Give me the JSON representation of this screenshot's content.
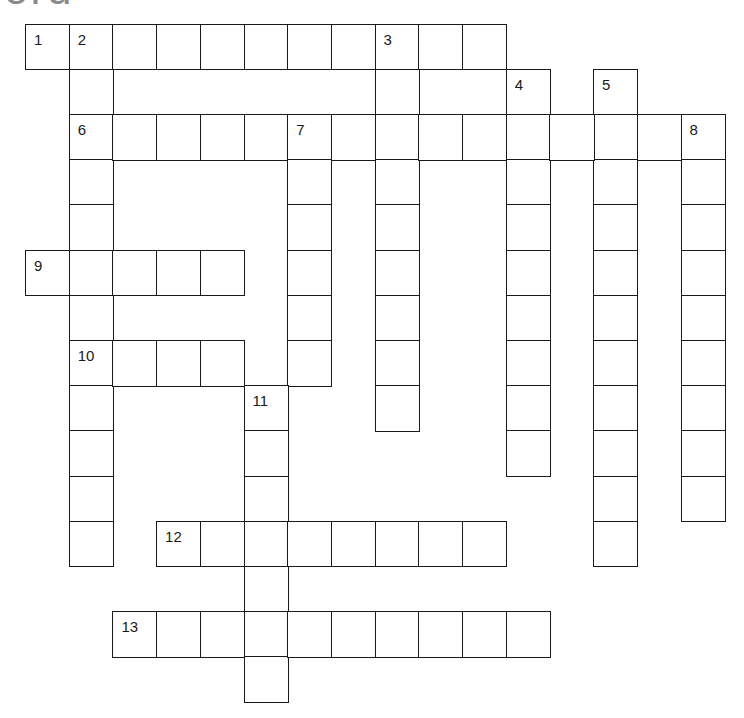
{
  "page": {
    "title_fragment": "ord"
  },
  "grid": {
    "origin_x": 25,
    "origin_y": 23.5,
    "cell_w": 43.7,
    "cell_h": 45.2,
    "border_color": "#1a1a1a",
    "cell_fill": "#ffffff"
  },
  "entries": [
    {
      "number": "1",
      "direction": "across",
      "row": 0,
      "col": 0,
      "length": 11
    },
    {
      "number": "2",
      "direction": "down",
      "row": 0,
      "col": 1,
      "length": 12
    },
    {
      "number": "3",
      "direction": "down",
      "row": 0,
      "col": 8,
      "length": 9
    },
    {
      "number": "4",
      "direction": "down",
      "row": 1,
      "col": 11,
      "length": 9
    },
    {
      "number": "5",
      "direction": "down",
      "row": 1,
      "col": 13,
      "length": 11
    },
    {
      "number": "6",
      "direction": "across",
      "row": 2,
      "col": 1,
      "length": 15
    },
    {
      "number": "7",
      "direction": "down",
      "row": 2,
      "col": 6,
      "length": 6
    },
    {
      "number": "8",
      "direction": "down",
      "row": 2,
      "col": 15,
      "length": 9
    },
    {
      "number": "9",
      "direction": "across",
      "row": 5,
      "col": 0,
      "length": 5
    },
    {
      "number": "10",
      "direction": "across",
      "row": 7,
      "col": 1,
      "length": 4
    },
    {
      "number": "11",
      "direction": "down",
      "row": 8,
      "col": 5,
      "length": 7
    },
    {
      "number": "12",
      "direction": "across",
      "row": 11,
      "col": 3,
      "length": 8
    },
    {
      "number": "13",
      "direction": "across",
      "row": 13,
      "col": 2,
      "length": 10
    }
  ]
}
